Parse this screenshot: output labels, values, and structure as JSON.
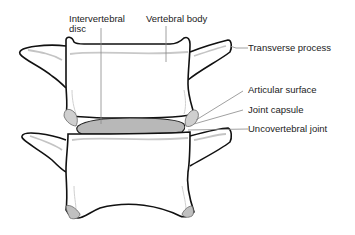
{
  "diagram": {
    "labels": {
      "intervertebral_disc_line1": "Intervertebral",
      "intervertebral_disc_line2": "disc",
      "vertebral_body": "Vertebral body",
      "transverse_process": "Transverse process",
      "articular_surface": "Articular surface",
      "joint_capsule": "Joint capsule",
      "uncovertebral_joint": "Uncovertebral joint"
    },
    "colors": {
      "outline": "#111111",
      "shading": "#bdbdbd",
      "disc_fill": "#b8b8b8",
      "leader": "#888888",
      "text": "#222222",
      "background": "#ffffff"
    }
  }
}
